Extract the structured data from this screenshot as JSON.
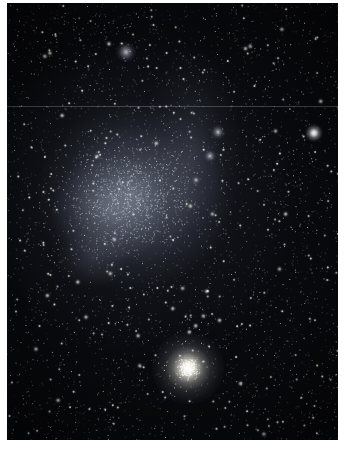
{
  "image": {
    "kind": "astronomical-photograph",
    "subject_label": "dwarf irregular galaxy with globular cluster",
    "width": 345,
    "height": 452,
    "background_paper_color": "#ffffff"
  },
  "plate": {
    "name": "photographic-plate",
    "left": 7,
    "top": 3,
    "width": 331,
    "height": 437,
    "sky_color": "#07080b",
    "deep_sky_color": "#040406"
  },
  "features": {
    "galaxy_body": {
      "label": "diffuse galaxy body",
      "center_x": 0.38,
      "center_y": 0.44,
      "glow_color": "#a8b0c4"
    },
    "globular_cluster": {
      "label": "globular cluster",
      "x": 188,
      "y": 368,
      "radius": 36,
      "core_color": "#fffffc"
    },
    "bright_star": {
      "label": "bright foreground star",
      "x": 314,
      "y": 133,
      "radius": 9,
      "color": "#ffffff"
    },
    "knots": [
      {
        "label": "nebulous knot upper right",
        "x": 218,
        "y": 132,
        "radius": 7
      },
      {
        "label": "nebulous knot mid right",
        "x": 210,
        "y": 156,
        "radius": 6
      },
      {
        "label": "star association upper left",
        "x": 126,
        "y": 52,
        "radius": 10
      },
      {
        "label": "faint knot lower body",
        "x": 196,
        "y": 180,
        "radius": 4
      }
    ],
    "artifact": {
      "label": "horizontal scan line artifact",
      "y": 106,
      "color": "#848a92"
    }
  },
  "starfield": {
    "label": "background star field",
    "seed": 20240731,
    "layers": [
      {
        "name": "faint-stars",
        "count": 2600,
        "size": 1,
        "min_alpha": 0.1,
        "max_alpha": 0.42,
        "tint": "#b9c0cc"
      },
      {
        "name": "medium-stars",
        "count": 900,
        "size": 1,
        "min_alpha": 0.38,
        "max_alpha": 0.78,
        "tint": "#d8dde6"
      },
      {
        "name": "bright-stars",
        "count": 230,
        "size": 2,
        "min_alpha": 0.7,
        "max_alpha": 1.0,
        "tint": "#ffffff"
      },
      {
        "name": "brightest-stars",
        "count": 34,
        "size": 3,
        "min_alpha": 0.85,
        "max_alpha": 1.0,
        "tint": "#fffdf6"
      }
    ],
    "cluster_stars": {
      "name": "globular-member-stars",
      "count": 300,
      "tint": "#fffef8"
    },
    "galaxy_stars": {
      "name": "resolved-galaxy-stars",
      "count": 950,
      "tint": "#ccd3e0"
    }
  }
}
